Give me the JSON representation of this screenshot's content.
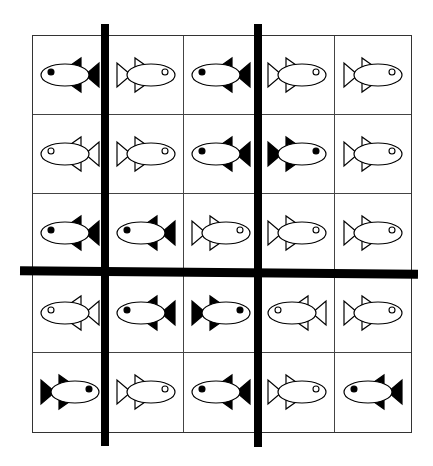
{
  "puzzle": {
    "rows": 5,
    "cols": 5,
    "line_color": "#000000",
    "fill_colors": {
      "black": "#000000",
      "white": "#ffffff"
    },
    "fish": [
      [
        {
          "dir": "left",
          "fill": "black"
        },
        {
          "dir": "right",
          "fill": "white"
        },
        {
          "dir": "left",
          "fill": "black"
        },
        {
          "dir": "right",
          "fill": "white"
        },
        {
          "dir": "right",
          "fill": "white"
        }
      ],
      [
        {
          "dir": "left",
          "fill": "white"
        },
        {
          "dir": "right",
          "fill": "white"
        },
        {
          "dir": "left",
          "fill": "black"
        },
        {
          "dir": "right",
          "fill": "black"
        },
        {
          "dir": "right",
          "fill": "white"
        }
      ],
      [
        {
          "dir": "left",
          "fill": "black"
        },
        {
          "dir": "left",
          "fill": "black"
        },
        {
          "dir": "right",
          "fill": "white"
        },
        {
          "dir": "right",
          "fill": "white"
        },
        {
          "dir": "right",
          "fill": "white"
        }
      ],
      [
        {
          "dir": "left",
          "fill": "white"
        },
        {
          "dir": "left",
          "fill": "black"
        },
        {
          "dir": "right",
          "fill": "black"
        },
        {
          "dir": "left",
          "fill": "white"
        },
        {
          "dir": "right",
          "fill": "white"
        }
      ],
      [
        {
          "dir": "right",
          "fill": "black"
        },
        {
          "dir": "right",
          "fill": "white"
        },
        {
          "dir": "left",
          "fill": "black"
        },
        {
          "dir": "right",
          "fill": "white"
        },
        {
          "dir": "left",
          "fill": "black"
        }
      ]
    ],
    "thick_lines": [
      {
        "orientation": "vertical",
        "after_col": 1,
        "x": 101,
        "y1": 24,
        "y2": 446,
        "width": 8
      },
      {
        "orientation": "vertical",
        "after_col": 3,
        "x": 254,
        "y1": 24,
        "y2": 447,
        "width": 8
      },
      {
        "orientation": "horizontal",
        "after_row": 3,
        "y": 268,
        "x1": 20,
        "x2": 418,
        "height": 9
      }
    ]
  }
}
